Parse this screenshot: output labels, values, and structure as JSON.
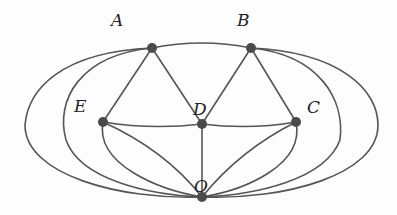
{
  "diagram": {
    "type": "graph",
    "nodes": [
      {
        "id": "A",
        "label": "A",
        "x": 152,
        "y": 48
      },
      {
        "id": "B",
        "label": "B",
        "x": 251,
        "y": 48
      },
      {
        "id": "E",
        "label": "E",
        "x": 103,
        "y": 122
      },
      {
        "id": "D",
        "label": "D",
        "x": 202,
        "y": 124
      },
      {
        "id": "C",
        "label": "C",
        "x": 296,
        "y": 122
      },
      {
        "id": "O",
        "label": "O",
        "x": 202,
        "y": 197
      }
    ],
    "edges": [
      [
        "A",
        "B"
      ],
      [
        "A",
        "E"
      ],
      [
        "A",
        "D"
      ],
      [
        "B",
        "D"
      ],
      [
        "B",
        "C"
      ],
      [
        "E",
        "D"
      ],
      [
        "D",
        "C"
      ],
      [
        "D",
        "O"
      ],
      [
        "E",
        "O"
      ],
      [
        "E",
        "O"
      ],
      [
        "C",
        "O"
      ],
      [
        "C",
        "O"
      ],
      [
        "A",
        "O"
      ],
      [
        "A",
        "O"
      ],
      [
        "B",
        "O"
      ],
      [
        "B",
        "O"
      ]
    ],
    "colors": {
      "edge": "#555555",
      "node": "#4a4a4a",
      "label": "#222222"
    }
  },
  "labels": {
    "A": "A",
    "B": "B",
    "C": "C",
    "D": "D",
    "E": "E",
    "O": "O"
  }
}
